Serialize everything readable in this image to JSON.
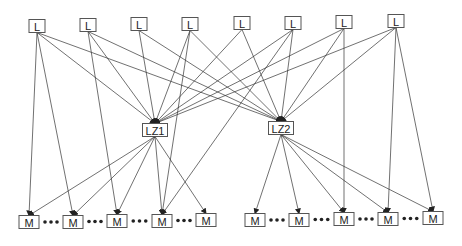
{
  "diagram": {
    "type": "layered directed graph",
    "colors": {
      "edge": "#333333",
      "node_border": "#555555",
      "node_fill": "#ffffff",
      "text": "#222222",
      "background": "#ffffff"
    },
    "nodes": [
      {
        "id": "L1",
        "label": "L",
        "layer": "top",
        "x": 37,
        "y": 26,
        "w": 16,
        "h": 13
      },
      {
        "id": "L2",
        "label": "L",
        "layer": "top",
        "x": 88,
        "y": 25,
        "w": 16,
        "h": 13
      },
      {
        "id": "L3",
        "label": "L",
        "layer": "top",
        "x": 139,
        "y": 24,
        "w": 16,
        "h": 13
      },
      {
        "id": "L4",
        "label": "L",
        "layer": "top",
        "x": 190,
        "y": 24,
        "w": 16,
        "h": 13
      },
      {
        "id": "L5",
        "label": "L",
        "layer": "top",
        "x": 242,
        "y": 23,
        "w": 16,
        "h": 13
      },
      {
        "id": "L6",
        "label": "L",
        "layer": "top",
        "x": 293,
        "y": 23,
        "w": 16,
        "h": 13
      },
      {
        "id": "L7",
        "label": "L",
        "layer": "top",
        "x": 344,
        "y": 22,
        "w": 16,
        "h": 13
      },
      {
        "id": "L8",
        "label": "L",
        "layer": "top",
        "x": 396,
        "y": 21,
        "w": 16,
        "h": 13
      },
      {
        "id": "LZ1",
        "label": "LZ1",
        "layer": "middle",
        "x": 155,
        "y": 130,
        "w": 25,
        "h": 13
      },
      {
        "id": "LZ2",
        "label": "LZ2",
        "layer": "middle",
        "x": 281,
        "y": 128,
        "w": 25,
        "h": 13
      },
      {
        "id": "M1",
        "label": "M",
        "layer": "bottom",
        "x": 29,
        "y": 222,
        "w": 20,
        "h": 13
      },
      {
        "id": "M2",
        "label": "M",
        "layer": "bottom",
        "x": 73,
        "y": 222,
        "w": 20,
        "h": 13
      },
      {
        "id": "M3",
        "label": "M",
        "layer": "bottom",
        "x": 117,
        "y": 221,
        "w": 20,
        "h": 13
      },
      {
        "id": "M4",
        "label": "M",
        "layer": "bottom",
        "x": 162,
        "y": 221,
        "w": 20,
        "h": 13
      },
      {
        "id": "M5",
        "label": "M",
        "layer": "bottom",
        "x": 206,
        "y": 220,
        "w": 20,
        "h": 13
      },
      {
        "id": "M6",
        "label": "M",
        "layer": "bottom",
        "x": 255,
        "y": 220,
        "w": 20,
        "h": 13
      },
      {
        "id": "M7",
        "label": "M",
        "layer": "bottom",
        "x": 299,
        "y": 220,
        "w": 20,
        "h": 13
      },
      {
        "id": "M8",
        "label": "M",
        "layer": "bottom",
        "x": 344,
        "y": 219,
        "w": 20,
        "h": 13
      },
      {
        "id": "M9",
        "label": "M",
        "layer": "bottom",
        "x": 388,
        "y": 219,
        "w": 20,
        "h": 13
      },
      {
        "id": "M10",
        "label": "M",
        "layer": "bottom",
        "x": 433,
        "y": 218,
        "w": 20,
        "h": 13
      }
    ],
    "edges": [
      [
        "L1",
        "M1"
      ],
      [
        "L1",
        "M2"
      ],
      [
        "L1",
        "LZ1"
      ],
      [
        "L1",
        "LZ2"
      ],
      [
        "L2",
        "M3"
      ],
      [
        "L2",
        "LZ1"
      ],
      [
        "L2",
        "LZ2"
      ],
      [
        "L3",
        "LZ1"
      ],
      [
        "L3",
        "LZ2"
      ],
      [
        "L4",
        "LZ1"
      ],
      [
        "L4",
        "M4"
      ],
      [
        "L4",
        "LZ2"
      ],
      [
        "L5",
        "LZ1"
      ],
      [
        "L5",
        "LZ2"
      ],
      [
        "L6",
        "LZ1"
      ],
      [
        "L6",
        "LZ2"
      ],
      [
        "L6",
        "M4"
      ],
      [
        "L7",
        "LZ1"
      ],
      [
        "L7",
        "LZ2"
      ],
      [
        "L7",
        "M8"
      ],
      [
        "L8",
        "LZ1"
      ],
      [
        "L8",
        "LZ2"
      ],
      [
        "L8",
        "M9"
      ],
      [
        "L8",
        "M10"
      ],
      [
        "LZ1",
        "M1"
      ],
      [
        "LZ1",
        "M2"
      ],
      [
        "LZ1",
        "M3"
      ],
      [
        "LZ1",
        "M4"
      ],
      [
        "LZ1",
        "M5"
      ],
      [
        "LZ2",
        "M6"
      ],
      [
        "LZ2",
        "M7"
      ],
      [
        "LZ2",
        "M8"
      ],
      [
        "LZ2",
        "M9"
      ],
      [
        "LZ2",
        "M10"
      ]
    ],
    "ellipsis_groups": [
      {
        "between": [
          "M1",
          "M2"
        ]
      },
      {
        "between": [
          "M2",
          "M3"
        ]
      },
      {
        "between": [
          "M3",
          "M4"
        ]
      },
      {
        "between": [
          "M4",
          "M5"
        ]
      },
      {
        "between": [
          "M6",
          "M7"
        ]
      },
      {
        "between": [
          "M7",
          "M8"
        ]
      },
      {
        "between": [
          "M8",
          "M9"
        ]
      },
      {
        "between": [
          "M9",
          "M10"
        ]
      }
    ],
    "ellipsis_glyph": "•••"
  }
}
